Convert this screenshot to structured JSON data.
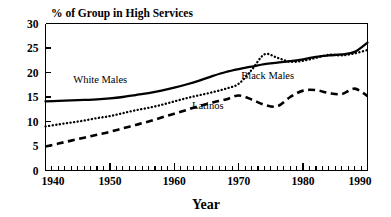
{
  "chart_data": {
    "type": "line",
    "title": "% of Group in High Services",
    "xlabel": "Year",
    "ylabel": "",
    "xlim": [
      1940,
      1990
    ],
    "ylim": [
      0,
      30
    ],
    "grid": false,
    "legend_position": "inline-annotations",
    "x_ticks": [
      1940,
      1950,
      1960,
      1970,
      1980,
      1990
    ],
    "x_tick_labels": [
      "1940",
      "1950",
      "1960",
      "1970",
      "1980",
      "1990"
    ],
    "x_minor_tick_step": 1,
    "y_ticks": [
      0,
      5,
      10,
      15,
      20,
      25,
      30
    ],
    "y_tick_labels": [
      "0",
      "5",
      "10",
      "15",
      "20",
      "25",
      "30"
    ],
    "x": [
      1940,
      1942,
      1944,
      1946,
      1948,
      1950,
      1952,
      1954,
      1956,
      1958,
      1960,
      1962,
      1964,
      1966,
      1968,
      1970,
      1972,
      1974,
      1976,
      1978,
      1980,
      1982,
      1984,
      1986,
      1988,
      1990
    ],
    "series": [
      {
        "name": "White Males",
        "style": "solid",
        "label": "White Males",
        "values": [
          14.1,
          14.2,
          14.3,
          14.4,
          14.5,
          14.7,
          15.0,
          15.4,
          15.8,
          16.3,
          16.9,
          17.6,
          18.4,
          19.3,
          20.1,
          20.7,
          21.2,
          21.7,
          22.0,
          22.3,
          22.7,
          23.2,
          23.5,
          23.7,
          24.2,
          26.1
        ]
      },
      {
        "name": "Black Males",
        "style": "dotted",
        "label": "Black Males",
        "values": [
          9.0,
          9.4,
          9.8,
          10.2,
          10.7,
          11.1,
          11.7,
          12.3,
          12.8,
          13.4,
          14.1,
          14.8,
          15.4,
          16.0,
          16.7,
          17.7,
          20.5,
          23.7,
          23.0,
          22.2,
          22.4,
          23.0,
          23.6,
          23.5,
          23.9,
          24.6
        ]
      },
      {
        "name": "Latinos",
        "style": "dashed",
        "label": "Latinos",
        "values": [
          4.9,
          5.5,
          6.1,
          6.7,
          7.3,
          7.9,
          8.6,
          9.3,
          10.0,
          10.8,
          11.6,
          12.4,
          13.2,
          13.9,
          14.5,
          15.3,
          14.5,
          13.4,
          13.1,
          15.0,
          16.3,
          16.4,
          15.8,
          15.6,
          16.7,
          15.2
        ]
      }
    ],
    "annotations": [
      {
        "text": "White Males",
        "x": 1948.5,
        "y": 17.8,
        "name": "white-males"
      },
      {
        "text": "Black Males",
        "x": 1974.5,
        "y": 18.6,
        "name": "black-males"
      },
      {
        "text": "Latinos",
        "x": 1965.2,
        "y": 12.6,
        "name": "latinos"
      }
    ]
  }
}
